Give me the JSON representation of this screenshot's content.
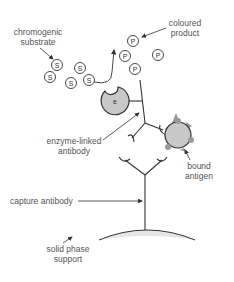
{
  "labels": {
    "chromogenic_substrate": [
      "chromogenic",
      "substrate"
    ],
    "coloured_product": [
      "coloured",
      "product"
    ],
    "enzyme_linked_antibody": [
      "enzyme-linked",
      "antibody"
    ],
    "bound_antigen": [
      "bound",
      "antigen"
    ],
    "capture_antibody": "capture antibody",
    "solid_phase_support": [
      "solid phase",
      "support"
    ]
  },
  "symbols": {
    "substrate": "S",
    "product": "P",
    "enzyme": "e"
  },
  "colors": {
    "line": "#333333",
    "text": "#555555",
    "enzyme_fill": "#c8c8c8",
    "antigen_fill": "#c8c8c8",
    "epitope_fill": "#999999",
    "support_fill": "#e6e6e6"
  },
  "substrate_molecules": [
    {
      "x": 57,
      "y": 65
    },
    {
      "x": 80,
      "y": 68
    },
    {
      "x": 50,
      "y": 77
    },
    {
      "x": 71,
      "y": 83
    },
    {
      "x": 89,
      "y": 80
    }
  ],
  "product_molecules": [
    {
      "x": 133,
      "y": 41
    },
    {
      "x": 125,
      "y": 56
    },
    {
      "x": 158,
      "y": 55
    },
    {
      "x": 135,
      "y": 69
    }
  ]
}
